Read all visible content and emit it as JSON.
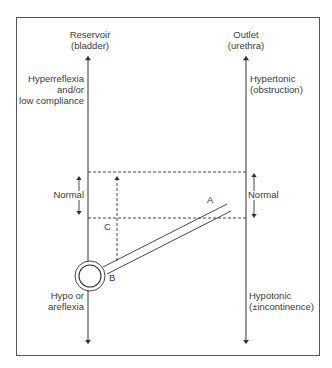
{
  "diagram": {
    "left_axis": {
      "title": "Reservoir",
      "subtitle": "(bladder)",
      "top_label": [
        "Hyperreflexia",
        "and/or",
        "low compliance"
      ],
      "middle_label": "Normal",
      "bottom_label": [
        "Hypo or",
        "areflexia"
      ]
    },
    "right_axis": {
      "title": "Outlet",
      "subtitle": "(urethra)",
      "top_label": [
        "Hypertonic",
        "(obstruction)"
      ],
      "middle_label": "Normal",
      "bottom_label": [
        "Hypotonic",
        "(±incontinence)"
      ]
    },
    "markers": {
      "a": "A",
      "b": "B",
      "c": "C"
    },
    "colors": {
      "line": "#333333",
      "frame": "#555555",
      "background": "#ffffff"
    }
  }
}
